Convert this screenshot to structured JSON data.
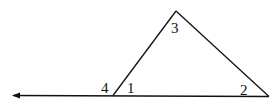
{
  "diagram": {
    "type": "triangle with extended base (exterior angle)",
    "angle_labels": {
      "apex": "3",
      "left_exterior": "4",
      "left_interior": "1",
      "right_interior": "2"
    },
    "colors": {
      "stroke": "#111111",
      "background": "#ffffff"
    }
  }
}
